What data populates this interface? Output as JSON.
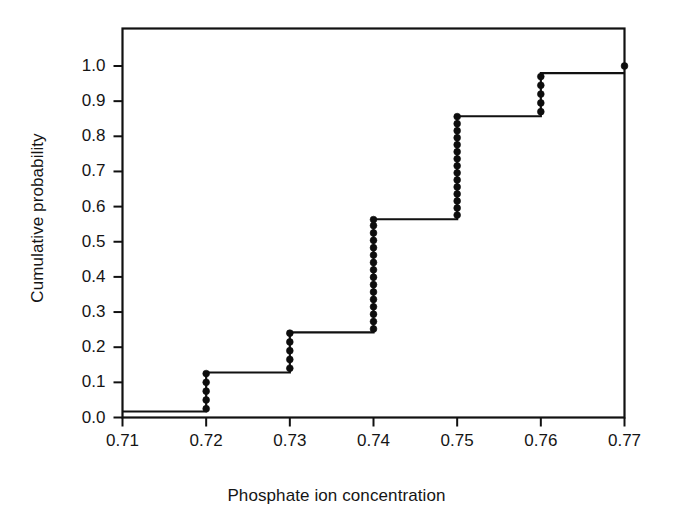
{
  "figure": {
    "background_color": "#ffffff",
    "line_color": "#111111",
    "marker_color": "#0d0d0d"
  },
  "chart_data": {
    "type": "line",
    "subtype": "empirical-cdf-step",
    "title": "",
    "xlabel": "Phosphate ion concentration",
    "ylabel": "Cumulative probability",
    "xlim": [
      0.71,
      0.77
    ],
    "ylim": [
      0.0,
      1.0
    ],
    "grid": false,
    "legend": null,
    "xticks": [
      0.71,
      0.72,
      0.73,
      0.74,
      0.75,
      0.76,
      0.77
    ],
    "xtick_labels": [
      "0.71",
      "0.72",
      "0.73",
      "0.74",
      "0.75",
      "0.76",
      "0.77"
    ],
    "yticks": [
      0.0,
      0.1,
      0.2,
      0.3,
      0.4,
      0.5,
      0.6,
      0.7,
      0.8,
      0.9,
      1.0
    ],
    "ytick_labels": [
      "0.0",
      "0.1",
      "0.2",
      "0.3",
      "0.4",
      "0.5",
      "0.6",
      "0.7",
      "0.8",
      "0.9",
      "1.0"
    ],
    "n_observations": 40,
    "step_levels": [
      {
        "x": 0.71,
        "y_low": 0.017,
        "y_high": 0.017
      },
      {
        "x": 0.72,
        "y_low": 0.025,
        "y_high": 0.128
      },
      {
        "x": 0.73,
        "y_low": 0.128,
        "y_high": 0.242
      },
      {
        "x": 0.74,
        "y_low": 0.242,
        "y_high": 0.564
      },
      {
        "x": 0.75,
        "y_low": 0.564,
        "y_high": 0.857
      },
      {
        "x": 0.76,
        "y_low": 0.857,
        "y_high": 0.97
      },
      {
        "x": 0.77,
        "y_low": 0.98,
        "y_high": 1.0
      }
    ],
    "step_path_points": [
      [
        0.71,
        0.017
      ],
      [
        0.72,
        0.017
      ],
      [
        0.72,
        0.128
      ],
      [
        0.73,
        0.128
      ],
      [
        0.73,
        0.242
      ],
      [
        0.74,
        0.242
      ],
      [
        0.74,
        0.564
      ],
      [
        0.75,
        0.564
      ],
      [
        0.75,
        0.857
      ],
      [
        0.76,
        0.857
      ],
      [
        0.76,
        0.98
      ],
      [
        0.77,
        0.98
      ]
    ],
    "markers": {
      "shape": "filled-circle",
      "groups": [
        {
          "x": 0.72,
          "count": 5,
          "y_values": [
            0.025,
            0.05,
            0.075,
            0.1,
            0.125
          ]
        },
        {
          "x": 0.73,
          "count": 5,
          "y_values": [
            0.14,
            0.165,
            0.19,
            0.215,
            0.24
          ]
        },
        {
          "x": 0.74,
          "count": 16,
          "y_values": [
            0.252,
            0.273,
            0.294,
            0.315,
            0.336,
            0.357,
            0.378,
            0.399,
            0.42,
            0.441,
            0.462,
            0.483,
            0.504,
            0.525,
            0.546,
            0.563
          ]
        },
        {
          "x": 0.75,
          "count": 15,
          "y_values": [
            0.576,
            0.596,
            0.616,
            0.636,
            0.656,
            0.676,
            0.696,
            0.716,
            0.736,
            0.756,
            0.776,
            0.796,
            0.816,
            0.836,
            0.856
          ]
        },
        {
          "x": 0.76,
          "count": 5,
          "y_values": [
            0.87,
            0.895,
            0.92,
            0.945,
            0.97
          ]
        },
        {
          "x": 0.77,
          "count": 1,
          "y_values": [
            1.0
          ]
        }
      ]
    }
  }
}
